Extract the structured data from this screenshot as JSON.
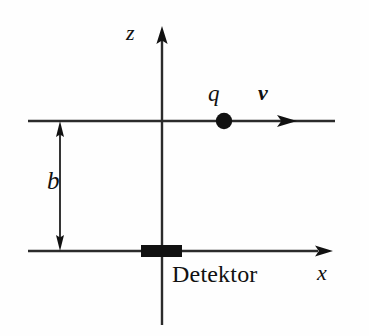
{
  "figure": {
    "background_color": "#fefefe",
    "ink_color": "#111111",
    "width": 369,
    "height": 336
  },
  "axes": {
    "vertical": {
      "label": "z",
      "name": "z-axis",
      "arrow_direction": "up",
      "top_y": 28,
      "bottom_y": 325,
      "x": 162
    },
    "horizontal": {
      "label": "x",
      "name": "x-axis",
      "arrow_direction": "right",
      "left_x": 28,
      "right_x": 332,
      "y": 251
    }
  },
  "particle": {
    "charge_label": "q",
    "velocity_label": "v",
    "dot_radius": 8,
    "dot_x": 224,
    "dot_y": 121,
    "trajectory_left_x": 28,
    "trajectory_right_x": 335,
    "trajectory_y": 121,
    "velocity_arrow_tip_x": 296
  },
  "dimension": {
    "label": "b",
    "x": 60,
    "top_y": 121,
    "bottom_y": 251,
    "style": "double-headed-arrow"
  },
  "detector": {
    "label": "Detektor",
    "block_x": 141,
    "block_y": 245,
    "block_width": 41,
    "block_height": 12,
    "fill": "#111111"
  }
}
